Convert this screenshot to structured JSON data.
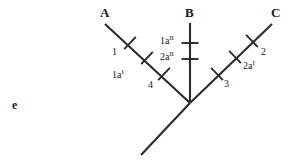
{
  "figure": {
    "panel_label": "e",
    "background_color": "#ffffff",
    "line_color": "#2b2b2b"
  },
  "taxa": [
    {
      "name": "A",
      "label": "A",
      "x": 100,
      "y": 6
    },
    {
      "name": "B",
      "label": "B",
      "x": 185,
      "y": 6
    },
    {
      "name": "C",
      "label": "C",
      "x": 271,
      "y": 6
    }
  ],
  "branch_labels": [
    {
      "name": "char-1",
      "text": "1",
      "sup": "",
      "x": 112,
      "y": 47
    },
    {
      "name": "char-1a-i",
      "text": "1a",
      "sup": "I",
      "x": 112,
      "y": 70
    },
    {
      "name": "char-4",
      "text": "4",
      "sup": "",
      "x": 148,
      "y": 80
    },
    {
      "name": "char-1a-ii",
      "text": "1a",
      "sup": "II",
      "x": 160,
      "y": 36
    },
    {
      "name": "char-2a-ii",
      "text": "2a",
      "sup": "II",
      "x": 160,
      "y": 52
    },
    {
      "name": "char-2",
      "text": "2",
      "sup": "",
      "x": 261,
      "y": 47
    },
    {
      "name": "char-2a-i",
      "text": "2a",
      "sup": "I",
      "x": 243,
      "y": 61
    },
    {
      "name": "char-3",
      "text": "3",
      "sup": "",
      "x": 224,
      "y": 79
    }
  ],
  "chart_data": {
    "type": "diagram",
    "title": "",
    "diagram_kind": "cladogram",
    "root": {
      "x": 190,
      "y": 103
    },
    "stem": {
      "from": [
        190,
        103
      ],
      "to": [
        141,
        155
      ]
    },
    "branches": [
      {
        "taxon": "A",
        "from": [
          190,
          103
        ],
        "to": [
          105,
          24
        ],
        "tick_marks": [
          {
            "label": "1",
            "superscript": "",
            "pos": [
              130,
              43
            ]
          },
          {
            "label": "1a",
            "superscript": "I",
            "pos": [
              147,
              58
            ]
          },
          {
            "label": "4",
            "superscript": "",
            "pos": [
              164,
              74
            ]
          }
        ]
      },
      {
        "taxon": "B",
        "from": [
          190,
          103
        ],
        "to": [
          190,
          23
        ],
        "tick_marks": [
          {
            "label": "1a",
            "superscript": "II",
            "pos": [
              190,
              43
            ]
          },
          {
            "label": "2a",
            "superscript": "II",
            "pos": [
              190,
              59
            ]
          }
        ]
      },
      {
        "taxon": "C",
        "from": [
          190,
          103
        ],
        "to": [
          272,
          24
        ],
        "tick_marks": [
          {
            "label": "3",
            "superscript": "",
            "pos": [
              217,
              74
            ]
          },
          {
            "label": "2a",
            "superscript": "I",
            "pos": [
              235,
              57
            ]
          },
          {
            "label": "2",
            "superscript": "",
            "pos": [
              252,
              41
            ]
          }
        ]
      }
    ]
  }
}
